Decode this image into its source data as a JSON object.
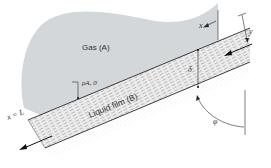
{
  "diagram": {
    "labels": {
      "gas": "Gas (A)",
      "liquid": "Liquid film (B)",
      "x_axis": "x",
      "y_axis": "y",
      "x_end": "x = L",
      "density": "ρA, 0",
      "thickness": "δ",
      "angle": "φ"
    },
    "colors": {
      "gas_region": "#d4d7d9",
      "film_fill": "#e9e9e9",
      "lines": "#2a2a2a",
      "background": "#ffffff"
    }
  }
}
